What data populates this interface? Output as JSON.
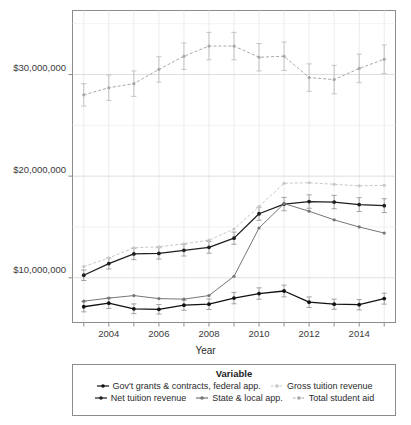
{
  "chart_data": {
    "type": "line",
    "title": "",
    "xlabel": "Year",
    "ylabel": "",
    "xlim": [
      2002.55,
      2015.45
    ],
    "ylim": [
      5600000,
      36300000
    ],
    "grid": true,
    "legend_position": "bottom",
    "legend_title": "Variable",
    "error_bars": true,
    "x": [
      2003,
      2004,
      2005,
      2006,
      2007,
      2008,
      2009,
      2010,
      2011,
      2012,
      2013,
      2014,
      2015
    ],
    "x_tick_labels": [
      "",
      "2004",
      "",
      "2006",
      "",
      "2008",
      "",
      "2010",
      "",
      "2012",
      "",
      "2014",
      ""
    ],
    "y_tick_values": [
      10000000,
      20000000,
      30000000
    ],
    "y_tick_labels": [
      "$10,000,000",
      "$20,000,000",
      "$30,000,000"
    ],
    "series": [
      {
        "name": "Gov't grants & contracts, federal app.",
        "color": "#111111",
        "dash": "solid",
        "values": [
          7150000,
          7500000,
          6950000,
          6900000,
          7300000,
          7400000,
          8000000,
          8450000,
          8700000,
          7600000,
          7400000,
          7350000,
          7950000
        ],
        "err": [
          500000,
          520000,
          480000,
          470000,
          500000,
          520000,
          560000,
          560000,
          580000,
          520000,
          500000,
          510000,
          540000
        ]
      },
      {
        "name": "Net tuition revenue",
        "color": "#1f1f1f",
        "dash": "solid",
        "values": [
          10250000,
          11400000,
          12350000,
          12400000,
          12700000,
          13000000,
          13900000,
          16300000,
          17250000,
          17500000,
          17450000,
          17200000,
          17100000
        ],
        "err": [
          520000,
          540000,
          560000,
          560000,
          560000,
          580000,
          600000,
          640000,
          660000,
          660000,
          660000,
          680000,
          680000
        ]
      },
      {
        "name": "State & local app.",
        "color": "#767676",
        "dash": "solid",
        "values": [
          7700000,
          8000000,
          8250000,
          7950000,
          7900000,
          8250000,
          10150000,
          14900000,
          17300000,
          16550000,
          15700000,
          15000000,
          14400000
        ]
      },
      {
        "name": "Gross tuition revenue",
        "color": "#c8c8c8",
        "dash": "dashed",
        "values": [
          11100000,
          11950000,
          12950000,
          13050000,
          13350000,
          13700000,
          14800000,
          17000000,
          19300000,
          19350000,
          19200000,
          19050000,
          19100000
        ]
      },
      {
        "name": "Total student aid",
        "color": "#a8a8a8",
        "dash": "dashed",
        "values": [
          28000000,
          28700000,
          29100000,
          30500000,
          31800000,
          32800000,
          32800000,
          31700000,
          31800000,
          29700000,
          29500000,
          30600000,
          31500000
        ],
        "err": [
          1100000,
          1250000,
          1250000,
          1250000,
          1300000,
          1350000,
          1350000,
          1350000,
          1400000,
          1350000,
          1400000,
          1400000,
          1400000
        ]
      }
    ]
  },
  "axis": {
    "x_title": "Year",
    "y_tick_labels": [
      "$30,000,000",
      "$20,000,000",
      "$10,000,000"
    ],
    "x_tick_labels": [
      "2004",
      "2006",
      "2008",
      "2010",
      "2012",
      "2014"
    ]
  },
  "legend": {
    "title": "Variable",
    "rows": [
      [
        {
          "label": "Gov't grants & contracts, federal app.",
          "color": "#111111",
          "dash": "solid"
        },
        {
          "label": "Gross tuition revenue",
          "color": "#c8c8c8",
          "dash": "dashed"
        }
      ],
      [
        {
          "label": "Net tuition revenue",
          "color": "#1f1f1f",
          "dash": "solid"
        },
        {
          "label": "State & local app.",
          "color": "#767676",
          "dash": "solid"
        },
        {
          "label": "Total student aid",
          "color": "#a8a8a8",
          "dash": "dashed"
        }
      ]
    ]
  }
}
